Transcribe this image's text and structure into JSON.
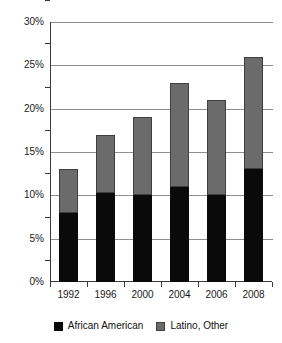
{
  "chart_data": {
    "type": "bar",
    "stacked": true,
    "title": "",
    "xlabel": "",
    "ylabel": "",
    "categories": [
      "1992",
      "1996",
      "2000",
      "2004",
      "2006",
      "2008"
    ],
    "series": [
      {
        "name": "African American",
        "color": "#0a0a0a",
        "values": [
          8,
          10.3,
          10,
          11,
          10,
          13
        ]
      },
      {
        "name": "Latino, Other",
        "color": "#6b6b6b",
        "values": [
          5,
          6.7,
          9,
          12,
          11,
          13
        ]
      }
    ],
    "totals": [
      13,
      17,
      19,
      23,
      21,
      26
    ],
    "ylim": [
      0,
      30
    ],
    "ytick_values": [
      0,
      5,
      10,
      15,
      20,
      25,
      30
    ],
    "ytick_labels": [
      "0%",
      "5%",
      "10%",
      "15%",
      "20%",
      "25%",
      "30%"
    ],
    "grid": true,
    "legend_position": "bottom"
  },
  "legend": {
    "items": [
      {
        "label": "African American"
      },
      {
        "label": "Latino, Other"
      }
    ]
  }
}
